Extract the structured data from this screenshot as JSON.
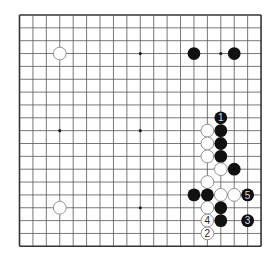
{
  "board": {
    "size": 19,
    "origin_x": 19.5,
    "origin_y": 15,
    "step_x": 13.42,
    "step_y": 12.85,
    "line_color": "#555555",
    "border_color": "#333333",
    "background": "#ffffff",
    "star_points": [
      [
        3,
        3
      ],
      [
        9,
        3
      ],
      [
        15,
        3
      ],
      [
        3,
        9
      ],
      [
        9,
        9
      ],
      [
        15,
        9
      ],
      [
        3,
        15
      ],
      [
        9,
        15
      ],
      [
        15,
        15
      ]
    ]
  },
  "stones": [
    {
      "color": "black",
      "col": 13,
      "row": 3
    },
    {
      "color": "black",
      "col": 16,
      "row": 3
    },
    {
      "color": "white",
      "col": 3,
      "row": 3
    },
    {
      "color": "white",
      "col": 3,
      "row": 15
    },
    {
      "color": "black",
      "col": 15,
      "row": 8,
      "label": "1"
    },
    {
      "color": "black",
      "col": 15,
      "row": 9
    },
    {
      "color": "black",
      "col": 15,
      "row": 10
    },
    {
      "color": "black",
      "col": 15,
      "row": 11
    },
    {
      "color": "white",
      "col": 14,
      "row": 9
    },
    {
      "color": "white",
      "col": 14,
      "row": 10
    },
    {
      "color": "white",
      "col": 14,
      "row": 11
    },
    {
      "color": "white",
      "col": 15,
      "row": 12
    },
    {
      "color": "black",
      "col": 16,
      "row": 12
    },
    {
      "color": "white",
      "col": 14,
      "row": 13
    },
    {
      "color": "black",
      "col": 13,
      "row": 14
    },
    {
      "color": "black",
      "col": 14,
      "row": 14
    },
    {
      "color": "white",
      "col": 15,
      "row": 14
    },
    {
      "color": "white",
      "col": 16,
      "row": 14
    },
    {
      "color": "black",
      "col": 17,
      "row": 14,
      "label": "5"
    },
    {
      "color": "white",
      "col": 14,
      "row": 15
    },
    {
      "color": "black",
      "col": 15,
      "row": 15
    },
    {
      "color": "white",
      "col": 14,
      "row": 16,
      "label": "4"
    },
    {
      "color": "black",
      "col": 15,
      "row": 16
    },
    {
      "color": "black",
      "col": 17,
      "row": 16,
      "label": "3"
    },
    {
      "color": "white",
      "col": 14,
      "row": 17,
      "label": "2"
    }
  ],
  "colors": {
    "black_stone": "#111111",
    "white_stone_fill": "#ffffff",
    "white_stone_stroke": "#888888",
    "label_on_black": "#dddddd",
    "label_on_white": "#222222"
  }
}
